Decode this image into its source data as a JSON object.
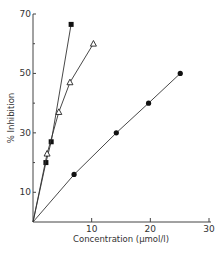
{
  "chart_data": {
    "type": "line",
    "title": "",
    "xlabel": "Concentration (μmol/l)",
    "ylabel": "% Inhibition",
    "xlim": [
      0,
      30
    ],
    "ylim": [
      0,
      70
    ],
    "x_ticks": [
      10,
      20,
      30
    ],
    "x_tick_labels": [
      "10",
      "20",
      "30"
    ],
    "y_ticks": [
      10,
      30,
      50,
      70
    ],
    "y_tick_labels": [
      "10",
      "30",
      "50",
      "70"
    ],
    "y_minor_ticks": [
      20,
      40,
      60
    ],
    "grid": false,
    "legend": "none",
    "series": [
      {
        "name": "filled squares",
        "marker": "square-filled",
        "x": [
          0,
          2.2,
          3.1,
          6.5
        ],
        "y": [
          0,
          20,
          27,
          66.5
        ]
      },
      {
        "name": "open triangles",
        "marker": "triangle-open",
        "x": [
          0,
          2.4,
          4.4,
          6.3,
          10.3
        ],
        "y": [
          0,
          23,
          37,
          47,
          60
        ]
      },
      {
        "name": "filled circles",
        "marker": "circle-filled",
        "x": [
          0,
          7.0,
          14.2,
          19.7,
          25.1
        ],
        "y": [
          0,
          16,
          30,
          40,
          50
        ]
      }
    ]
  }
}
